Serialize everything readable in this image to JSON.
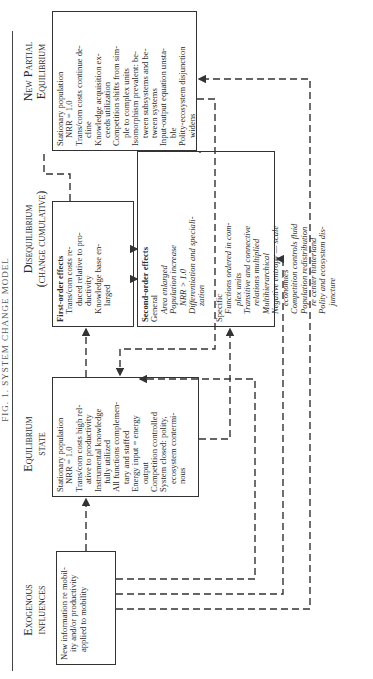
{
  "title": "FIG. 1. SYSTEM CHANGE MODEL",
  "columns": {
    "exogenous": {
      "line1": "Exogenous",
      "line2": "influences"
    },
    "equilibrium": {
      "line1": "Equilibrium",
      "line2": "state"
    },
    "disequilibrium": {
      "line1": "Disequilibrium",
      "line2": "(change cumulative)"
    },
    "new_partial": {
      "line1": "New Partial",
      "line2": "Equilibrium"
    }
  },
  "exogenous_box": {
    "lines": [
      "New information re mobil-",
      "ity and/or productivity",
      "applied to mobility"
    ]
  },
  "equilibrium_box": {
    "items": [
      "Stationary population",
      "NRR = 1.0",
      "Trans/com costs high rel-",
      "ative to productivity",
      "Instrumental knowledge",
      "fully utilized",
      "All functions complemen-",
      "tary and staffed",
      "Energy input = energy",
      "output",
      "Competition controlled",
      "System closed: polity,",
      "ecosystem contermi-",
      "nous"
    ]
  },
  "first_order_box": {
    "heading": "First-order effects",
    "items": [
      "Trans/com costs re-",
      "duced relative to pro-",
      "ductivity",
      "Knowledge base en-",
      "larged"
    ]
  },
  "second_order_box": {
    "heading": "Second-order effects",
    "general_label": "General",
    "general_items": [
      "Area enlarged",
      "Population increase",
      "NRR > 1.0",
      "Differentiation and speciali-",
      "zation"
    ],
    "specific_label": "Specific",
    "specific_items": [
      "Functions ordered in com-",
      "plex units",
      "Transitive and connective",
      "relations multiplied",
      "Multihierarchical",
      "Negative entropy — scale",
      "economies",
      "Competition controls fluid",
      "Population redistribution",
      "re center hinterland",
      "Polity and ecosystem dis-",
      "juncture"
    ]
  },
  "new_partial_box": {
    "items": [
      "Stationary population",
      "NRR = 1.0",
      "Trans/com costs continue de-",
      "cline",
      "Knowledge acquisition ex-",
      "ceeds utilization",
      "Competition shifts from sim-",
      "ple to complex units",
      "Isomorphism prevalent: be-",
      "tween subsystems and be-",
      "tween systems",
      "Input-output equation unsta-",
      "ble",
      "Polity-ecosystem disjunction",
      "widens"
    ]
  },
  "colors": {
    "ink": "#2a2a2a",
    "line": "#333333",
    "background": "#ffffff"
  }
}
